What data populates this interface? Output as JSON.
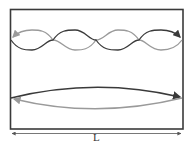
{
  "diagram": {
    "title": "",
    "type": "standing-wave-modes",
    "box": {
      "left": 10,
      "top": 9,
      "right": 183,
      "bottom": 129,
      "stroke": "#3a3a3a"
    },
    "modes": [
      {
        "name": "fourth-harmonic",
        "half_wavelengths": 4,
        "center_y": 40,
        "amplitude": 10,
        "forward_color": "#3a3a3a",
        "reflected_color": "#9a9a9a"
      },
      {
        "name": "fundamental",
        "half_wavelengths": 1,
        "center_y": 98,
        "amplitude": 10,
        "forward_color": "#3a3a3a",
        "reflected_color": "#9a9a9a"
      }
    ],
    "dimension": {
      "label": "L",
      "y": 133,
      "x1": 10,
      "x2": 183,
      "color": "#555555"
    }
  }
}
